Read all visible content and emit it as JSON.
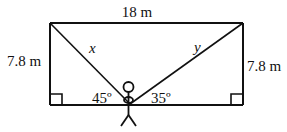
{
  "diagram": {
    "type": "geometry-word-problem",
    "colors": {
      "stroke": "#111111",
      "background": "#ffffff"
    },
    "labels": {
      "top_width": "18 m",
      "left_height": "7.8 m",
      "right_height": "7.8 m",
      "left_line": "x",
      "right_line": "y",
      "left_angle": "45º",
      "right_angle": "35º"
    },
    "geometry": {
      "rectangle": {
        "x1": 50,
        "y1": 23,
        "x2": 243,
        "y2": 105
      },
      "observer_point": {
        "x": 130,
        "y": 104
      },
      "right_angle_markers": [
        "bottom-left",
        "bottom-right"
      ]
    },
    "figure": "stick-figure"
  }
}
